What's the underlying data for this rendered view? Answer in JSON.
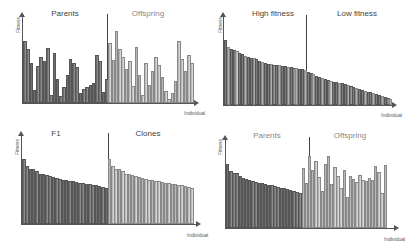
{
  "chart_data": [
    {
      "type": "bar",
      "panel": "top-left",
      "xlabel": "Individual",
      "ylabel": "Fitness",
      "groups": [
        {
          "name": "Parents",
          "shade": "dark",
          "values": [
            62,
            54,
            40,
            13,
            37,
            46,
            42,
            55,
            8,
            50,
            24,
            7,
            16,
            28,
            44,
            40,
            36,
            10,
            14,
            16,
            18,
            20,
            48,
            42,
            11,
            24
          ]
        },
        {
          "name": "Offspring",
          "shade": "light",
          "values": [
            60,
            43,
            72,
            54,
            46,
            34,
            42,
            17,
            56,
            28,
            8,
            40,
            18,
            32,
            46,
            38,
            26,
            12,
            4,
            10,
            22,
            62,
            44,
            32,
            48,
            40
          ]
        }
      ],
      "grid": false,
      "legend": "none",
      "annotations": [
        "Parents",
        "Offspring"
      ]
    },
    {
      "type": "bar",
      "panel": "top-right",
      "xlabel": "Individual",
      "ylabel": "Fitness",
      "groups": [
        {
          "name": "High fitness",
          "shade": "mixed",
          "values": [
            72,
            64,
            62,
            61,
            60,
            58,
            57,
            54,
            53,
            52,
            52,
            51,
            49,
            48,
            47,
            46,
            46,
            45,
            44,
            44,
            43,
            43,
            42,
            42,
            41,
            41,
            40,
            40,
            39
          ]
        },
        {
          "name": "Low fitness",
          "shade": "mixed",
          "values": [
            37,
            36,
            34,
            32,
            31,
            30,
            29,
            28,
            27,
            26,
            26,
            25,
            24,
            23,
            22,
            21,
            20,
            19,
            18,
            17,
            16,
            15,
            14,
            13,
            12,
            11,
            10,
            9,
            8,
            7
          ]
        }
      ],
      "grid": false,
      "legend": "none",
      "annotations": [
        "High fitness",
        "Low fitness"
      ]
    },
    {
      "type": "bar",
      "panel": "bottom-left",
      "xlabel": "Individual",
      "ylabel": "Fitness",
      "groups": [
        {
          "name": "F1",
          "shade": "dark",
          "values": [
            65,
            58,
            55,
            55,
            53,
            50,
            50,
            49,
            48,
            47,
            46,
            45,
            44,
            44,
            43,
            43,
            42,
            41,
            41,
            40,
            40,
            39,
            39,
            38,
            37,
            36
          ]
        },
        {
          "name": "Clones",
          "shade": "light",
          "values": [
            65,
            58,
            55,
            55,
            53,
            50,
            50,
            49,
            48,
            47,
            46,
            45,
            44,
            44,
            43,
            43,
            42,
            41,
            41,
            40,
            40,
            39,
            39,
            38,
            37,
            36
          ]
        }
      ],
      "grid": false,
      "legend": "none",
      "annotations": [
        "F1",
        "Clones"
      ]
    },
    {
      "type": "bar",
      "panel": "bottom-right",
      "xlabel": "Individual",
      "ylabel": "Fitness",
      "groups": [
        {
          "name": "Parents",
          "shade": "dark",
          "values": [
            64,
            57,
            55,
            55,
            52,
            50,
            49,
            48,
            47,
            46,
            45,
            45,
            44,
            43,
            43,
            42,
            41,
            40,
            40,
            39,
            38,
            37,
            36,
            35
          ]
        },
        {
          "name": "Offspring",
          "shade": "light",
          "values": [
            60,
            45,
            72,
            58,
            67,
            51,
            37,
            64,
            72,
            44,
            61,
            52,
            40,
            58,
            31,
            52,
            49,
            46,
            53,
            48,
            47,
            50,
            48,
            62,
            56,
            35,
            63
          ]
        }
      ],
      "grid": false,
      "legend": "none",
      "annotations": [
        "Parents",
        "Offspring"
      ]
    }
  ],
  "labels": {
    "fitness": "Fitness",
    "individual": "Individual",
    "p1_left": "Parents",
    "p1_right": "Offspring",
    "p2_left": "High fitness",
    "p2_right": "Low fitness",
    "p3_left": "F1",
    "p3_right": "Clones",
    "p4_left": "Parents",
    "p4_right": "Offspring"
  }
}
